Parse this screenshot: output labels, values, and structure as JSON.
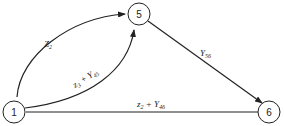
{
  "diagram": {
    "nodes": [
      {
        "id": "1",
        "label": "1"
      },
      {
        "id": "5",
        "label": "5"
      },
      {
        "id": "6",
        "label": "6"
      }
    ],
    "edges": [
      {
        "from": "1",
        "to": "5",
        "label_main": "Z",
        "label_sub": "2",
        "curve": "upper"
      },
      {
        "from": "1",
        "to": "5",
        "label_main": "z",
        "label_sub": "3",
        "label_plus": " + Y",
        "label_sub2": "45",
        "curve": "lower"
      },
      {
        "from": "5",
        "to": "6",
        "label_main": "Y",
        "label_sub": "56"
      },
      {
        "from": "1",
        "to": "6",
        "label_main": "z",
        "label_sub": "2",
        "label_plus": " + Y",
        "label_sub2": "46"
      }
    ]
  }
}
